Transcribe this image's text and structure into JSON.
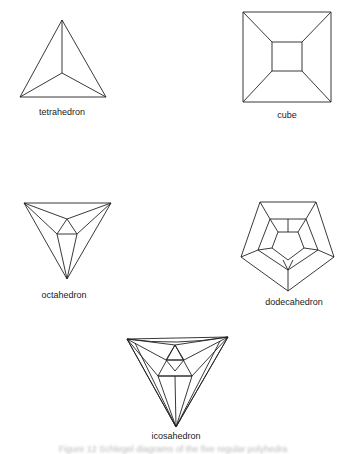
{
  "figure": {
    "diagrams": [
      {
        "id": "tetrahedron",
        "label": "tetrahedron"
      },
      {
        "id": "cube",
        "label": "cube"
      },
      {
        "id": "octahedron",
        "label": "octahedron"
      },
      {
        "id": "dodecahedron",
        "label": "dodecahedron"
      },
      {
        "id": "icosahedron",
        "label": "icosahedron"
      }
    ],
    "caption": "Figure 12  Schlegel diagrams of the five regular polyhedra",
    "stroke_color": "#222222",
    "background": "#ffffff"
  }
}
